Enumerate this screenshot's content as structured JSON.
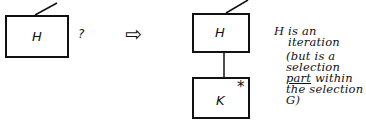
{
  "diagram": {
    "before": {
      "box_label": "H",
      "question_mark": "?"
    },
    "arrow": "⇨",
    "after": {
      "parent_box_label": "H",
      "child_box_label": "K",
      "child_marker": "*",
      "note_lines": [
        "H is an",
        "iteration",
        "(but is a",
        "selection",
        "part",
        " within",
        "the selection",
        "G)"
      ]
    }
  }
}
